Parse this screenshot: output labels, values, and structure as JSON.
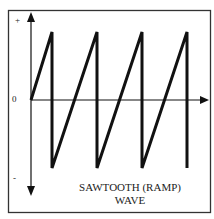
{
  "diagram": {
    "title_line1": "SAWTOOTH (RAMP)",
    "title_line2": "WAVE",
    "axis_labels": {
      "plus": "+",
      "zero": "0",
      "minus": "-"
    },
    "waveform": "sawtooth",
    "cycles": 4,
    "colors": {
      "line": "#111111",
      "background": "#ffffff"
    }
  }
}
